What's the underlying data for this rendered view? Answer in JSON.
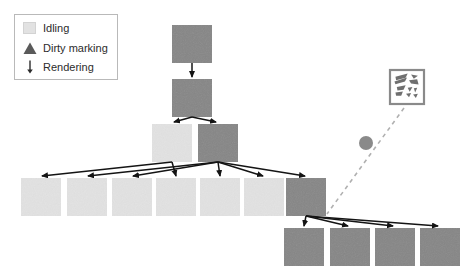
{
  "diagram": {
    "kind": "render-tree-dirty-marking-diagram",
    "canvas": {
      "width": 464,
      "height": 272,
      "background": "#ffffff"
    },
    "colors": {
      "idle_node": "#e2e2e2",
      "dirty_node": "#868686",
      "arrow": "#141414",
      "dashed": "#b0b0b0",
      "legend_border": "#b9b9b9",
      "text": "#2b2b2b",
      "pointer_circle": "#8a8a8a",
      "tile_border": "#8a8a8a"
    }
  },
  "legend": {
    "title": "",
    "items": [
      {
        "label": "Idling",
        "icon": "light-square-swatch",
        "color": "#e2e2e2"
      },
      {
        "label": "Dirty marking",
        "icon": "triangle-marker",
        "color": "#5a5a5a"
      },
      {
        "label": "Rendering",
        "icon": "down-arrow",
        "color": "#2b2b2b"
      }
    ]
  },
  "nodes": [
    {
      "id": "n-root",
      "state": "dirty",
      "x": 172,
      "y": 25,
      "w": 40,
      "h": 38
    },
    {
      "id": "n-l1",
      "state": "dirty",
      "x": 172,
      "y": 79,
      "w": 40,
      "h": 38
    },
    {
      "id": "n-l2a",
      "state": "idle",
      "x": 152,
      "y": 124,
      "w": 40,
      "h": 38
    },
    {
      "id": "n-l2b",
      "state": "dirty",
      "x": 198,
      "y": 124,
      "w": 40,
      "h": 38
    },
    {
      "id": "n-l3a",
      "state": "idle",
      "x": 21,
      "y": 178,
      "w": 40,
      "h": 38
    },
    {
      "id": "n-l3b",
      "state": "idle",
      "x": 67,
      "y": 178,
      "w": 40,
      "h": 38
    },
    {
      "id": "n-l3c",
      "state": "idle",
      "x": 112,
      "y": 178,
      "w": 40,
      "h": 38
    },
    {
      "id": "n-l3d",
      "state": "idle",
      "x": 156,
      "y": 178,
      "w": 40,
      "h": 38
    },
    {
      "id": "n-l3e",
      "state": "idle",
      "x": 200,
      "y": 178,
      "w": 40,
      "h": 38
    },
    {
      "id": "n-l3f",
      "state": "idle",
      "x": 244,
      "y": 178,
      "w": 40,
      "h": 38
    },
    {
      "id": "n-l3g",
      "state": "dirty",
      "x": 286,
      "y": 178,
      "w": 40,
      "h": 38
    },
    {
      "id": "n-l4a",
      "state": "dirty",
      "x": 284,
      "y": 228,
      "w": 40,
      "h": 38
    },
    {
      "id": "n-l4b",
      "state": "dirty",
      "x": 330,
      "y": 228,
      "w": 40,
      "h": 38
    },
    {
      "id": "n-l4c",
      "state": "dirty",
      "x": 375,
      "y": 228,
      "w": 40,
      "h": 38
    },
    {
      "id": "n-l4d",
      "state": "dirty",
      "x": 420,
      "y": 228,
      "w": 40,
      "h": 38
    }
  ],
  "edges": [
    {
      "from": "n-root",
      "to": "n-l1",
      "x1": 192,
      "y1": 63,
      "x2": 192,
      "y2": 77
    },
    {
      "from": "n-l1",
      "to": "n-l2a",
      "x1": 192,
      "y1": 117,
      "x2": 174,
      "y2": 122
    },
    {
      "from": "n-l1",
      "to": "n-l2b",
      "x1": 192,
      "y1": 117,
      "x2": 216,
      "y2": 122
    },
    {
      "from": "n-l2a",
      "to": "n-l3a",
      "x1": 172,
      "y1": 162,
      "x2": 42,
      "y2": 176
    },
    {
      "from": "n-l2a",
      "to": "n-l3d",
      "x1": 172,
      "y1": 162,
      "x2": 176,
      "y2": 176
    },
    {
      "from": "n-l2b",
      "to": "n-l3b",
      "x1": 218,
      "y1": 162,
      "x2": 88,
      "y2": 176
    },
    {
      "from": "n-l2b",
      "to": "n-l3c",
      "x1": 218,
      "y1": 162,
      "x2": 133,
      "y2": 176
    },
    {
      "from": "n-l2b",
      "to": "n-l3e",
      "x1": 218,
      "y1": 162,
      "x2": 220,
      "y2": 176
    },
    {
      "from": "n-l2b",
      "to": "n-l3f",
      "x1": 218,
      "y1": 162,
      "x2": 263,
      "y2": 176
    },
    {
      "from": "n-l2b",
      "to": "n-l3g",
      "x1": 218,
      "y1": 162,
      "x2": 305,
      "y2": 176
    },
    {
      "from": "n-l3g",
      "to": "n-l4a",
      "x1": 306,
      "y1": 216,
      "x2": 304,
      "y2": 226
    },
    {
      "from": "n-l3g",
      "to": "n-l4b",
      "x1": 306,
      "y1": 216,
      "x2": 348,
      "y2": 226
    },
    {
      "from": "n-l3g",
      "to": "n-l4c",
      "x1": 306,
      "y1": 216,
      "x2": 393,
      "y2": 226
    },
    {
      "from": "n-l3g",
      "to": "n-l4d",
      "x1": 306,
      "y1": 216,
      "x2": 438,
      "y2": 226
    }
  ],
  "pointer_trail": {
    "from_tile": "tile-thumbnail",
    "to_node": "n-l3g",
    "x1": 404,
    "y1": 108,
    "x2": 327,
    "y2": 214,
    "style": "dashed",
    "marker": {
      "shape": "circle",
      "cx": 366,
      "cy": 143,
      "r": 7
    }
  },
  "tile": {
    "id": "tile-thumbnail",
    "x": 390,
    "y": 70,
    "w": 34,
    "h": 34,
    "label": "",
    "description": "fragmented-pattern-thumbnail"
  }
}
